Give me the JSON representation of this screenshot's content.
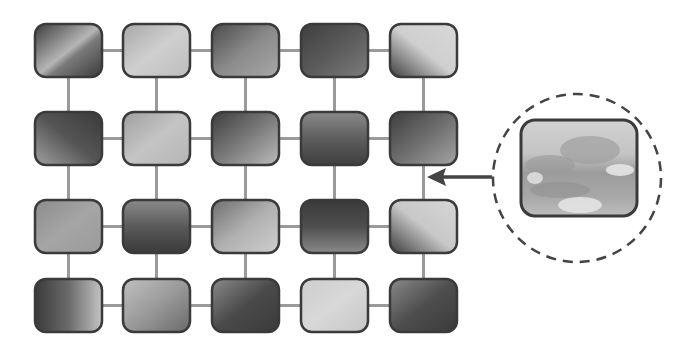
{
  "diagram": {
    "title": "",
    "grid": {
      "rows": 4,
      "cols": 5,
      "tiles": [
        [
          {
            "shade": "dark",
            "gradient": "diagonal-streak",
            "c1": "#3c3c3c",
            "c2": "#b5b5b5",
            "c3": "#3a3a3a"
          },
          {
            "shade": "light",
            "gradient": "soft",
            "c1": "#a8a8a8",
            "c2": "#cfcfcf",
            "c3": "#bdbdbd"
          },
          {
            "shade": "medium-dark",
            "gradient": "soft",
            "c1": "#4a4a4a",
            "c2": "#8a8a8a",
            "c3": "#a8a8a8"
          },
          {
            "shade": "dark",
            "gradient": "soft",
            "c1": "#3e3e3e",
            "c2": "#5a5a5a",
            "c3": "#7c7c7c"
          },
          {
            "shade": "light-corner-dark",
            "gradient": "corner",
            "c1": "#d8d8d8",
            "c2": "#cfcfcf",
            "c3": "#3e3e3e"
          }
        ],
        [
          {
            "shade": "dark",
            "gradient": "bottom-light",
            "c1": "#3a3a3a",
            "c2": "#555",
            "c3": "#a0a0a0"
          },
          {
            "shade": "light",
            "gradient": "soft",
            "c1": "#a0a0a0",
            "c2": "#c4c4c4",
            "c3": "#b5b5b5"
          },
          {
            "shade": "medium",
            "gradient": "soft",
            "c1": "#3e3e3e",
            "c2": "#7a7a7a",
            "c3": "#bcbcbc"
          },
          {
            "shade": "medium-dark",
            "gradient": "vertical",
            "c1": "#8a8a8a",
            "c2": "#5e5e5e",
            "c3": "#3e3e3e"
          },
          {
            "shade": "medium-dark",
            "gradient": "soft",
            "c1": "#3e3e3e",
            "c2": "#6e6e6e",
            "c3": "#a5a5a5"
          }
        ],
        [
          {
            "shade": "medium",
            "gradient": "soft",
            "c1": "#8c8c8c",
            "c2": "#a5a5a5",
            "c3": "#9a9a9a"
          },
          {
            "shade": "dark",
            "gradient": "vertical",
            "c1": "#8a8a8a",
            "c2": "#5a5a5a",
            "c3": "#3a3a3a"
          },
          {
            "shade": "light",
            "gradient": "soft",
            "c1": "#6e6e6e",
            "c2": "#b0b0b0",
            "c3": "#cfcfcf"
          },
          {
            "shade": "dark",
            "gradient": "vertical",
            "c1": "#3a3a3a",
            "c2": "#4e4e4e",
            "c3": "#8a8a8a"
          },
          {
            "shade": "light-corner-dark",
            "gradient": "corner",
            "c1": "#d6d6d6",
            "c2": "#c8c8c8",
            "c3": "#3c3c3c"
          }
        ],
        [
          {
            "shade": "dark",
            "gradient": "horizontal",
            "c1": "#3a3a3a",
            "c2": "#6a6a6a",
            "c3": "#c4c4c4"
          },
          {
            "shade": "medium",
            "gradient": "soft",
            "c1": "#c0c0c0",
            "c2": "#9a9a9a",
            "c3": "#6a6a6a"
          },
          {
            "shade": "dark",
            "gradient": "soft",
            "c1": "#8a8a8a",
            "c2": "#4a4a4a",
            "c3": "#3a3a3a"
          },
          {
            "shade": "light",
            "gradient": "soft",
            "c1": "#cdcdcd",
            "c2": "#d8d8d8",
            "c3": "#c6c6c6"
          },
          {
            "shade": "dark",
            "gradient": "soft",
            "c1": "#8a8a8a",
            "c2": "#4e4e4e",
            "c3": "#3a3a3a"
          }
        ]
      ]
    },
    "callout": {
      "source_tile": {
        "row": 2,
        "col": 5,
        "position": "between-rows-2-and-3"
      },
      "content": "magnified-image-tile",
      "style": "dashed-circle",
      "image_colors": {
        "sky": "#d2d2d2",
        "mid": "#9c9c9c",
        "ground": "#bdbdbd",
        "highlight": "#e6e6e6"
      }
    },
    "colors": {
      "background": "#ffffff",
      "connector": "#9a9a9a",
      "tile_border": "#3a3a3a",
      "arrow": "#444444"
    }
  }
}
